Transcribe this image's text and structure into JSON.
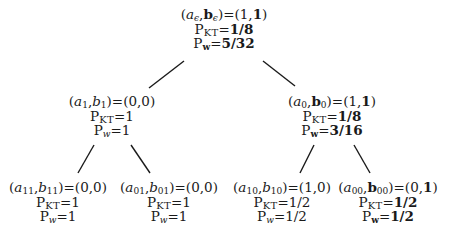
{
  "diagram": {
    "type": "binary-tree",
    "edges": [
      {
        "from": "root",
        "to": "n1"
      },
      {
        "from": "root",
        "to": "n0"
      },
      {
        "from": "n1",
        "to": "n11"
      },
      {
        "from": "n1",
        "to": "n01"
      },
      {
        "from": "n0",
        "to": "n10"
      },
      {
        "from": "n0",
        "to": "n00"
      }
    ],
    "nodes": {
      "root": {
        "a_sym": "a",
        "a_sub": "ϵ",
        "b_sym": "b",
        "b_sub": "ϵ",
        "b_bold": true,
        "eq": ")=(",
        "val_a": "1",
        "val_b": "1",
        "val_b_bold": true,
        "pkt_label": "P",
        "pkt_sub": "KT",
        "pkt_value": "1/8",
        "pkt_bold": true,
        "pw_label": "P",
        "pw_sub": "w",
        "pw_value": "5/32",
        "pw_bold": true
      },
      "n1": {
        "a_sym": "a",
        "a_sub": "1",
        "b_sym": "b",
        "b_sub": "1",
        "b_bold": false,
        "val_a": "0",
        "val_b": "0",
        "pkt_label": "P",
        "pkt_sub": "KT",
        "pkt_value": "1",
        "pw_label": "P",
        "pw_sub": "w",
        "pw_value": "1"
      },
      "n0": {
        "a_sym": "a",
        "a_sub": "0",
        "b_sym": "b",
        "b_sub": "0",
        "b_bold": true,
        "val_a": "1",
        "val_b": "1",
        "val_b_bold": true,
        "pkt_label": "P",
        "pkt_sub": "KT",
        "pkt_value": "1/8",
        "pkt_bold": true,
        "pw_label": "P",
        "pw_sub": "w",
        "pw_value": "3/16",
        "pw_bold": true
      },
      "n11": {
        "a_sym": "a",
        "a_sub": "11",
        "b_sym": "b",
        "b_sub": "11",
        "b_bold": false,
        "val_a": "0",
        "val_b": "0",
        "pkt_label": "P",
        "pkt_sub": "KT",
        "pkt_value": "1",
        "pw_label": "P",
        "pw_sub": "w",
        "pw_value": "1"
      },
      "n01": {
        "a_sym": "a",
        "a_sub": "01",
        "b_sym": "b",
        "b_sub": "01",
        "b_bold": false,
        "val_a": "0",
        "val_b": "0",
        "pkt_label": "P",
        "pkt_sub": "KT",
        "pkt_value": "1",
        "pw_label": "P",
        "pw_sub": "w",
        "pw_value": "1"
      },
      "n10": {
        "a_sym": "a",
        "a_sub": "10",
        "b_sym": "b",
        "b_sub": "10",
        "b_bold": false,
        "val_a": "1",
        "val_b": "0",
        "pkt_label": "P",
        "pkt_sub": "KT",
        "pkt_value": "1/2",
        "pw_label": "P",
        "pw_sub": "w",
        "pw_value": "1/2"
      },
      "n00": {
        "a_sym": "a",
        "a_sub": "00",
        "b_sym": "b",
        "b_sub": "00",
        "b_bold": true,
        "val_a": "0",
        "val_b": "1",
        "val_b_bold": true,
        "pkt_label": "P",
        "pkt_sub": "KT",
        "pkt_value": "1/2",
        "pkt_bold": true,
        "pw_label": "P",
        "pw_sub": "w",
        "pw_value": "1/2",
        "pw_bold": true
      }
    },
    "punct": {
      "open": "(",
      "comma": ",",
      "eq": ")=(",
      "close": ")",
      "equals": "="
    }
  }
}
